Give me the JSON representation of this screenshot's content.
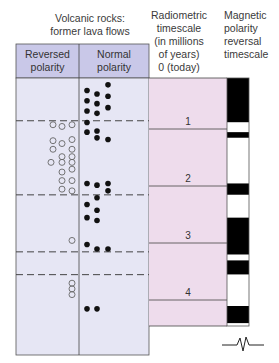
{
  "headers": {
    "volcanic_title": "Volcanic rocks: former lava flows",
    "volcanic_title_line1": "Volcanic rocks:",
    "volcanic_title_line2": "former lava flows",
    "reversed_line1": "Reversed",
    "reversed_line2": "polarity",
    "normal_line1": "Normal",
    "normal_line2": "polarity",
    "radiometric_lines": [
      "Radiometric",
      "timescale",
      "(in millions",
      "of years)",
      "0 (today)"
    ],
    "magnetic_lines": [
      "Magnetic",
      "polarity",
      "reversal",
      "timescale"
    ]
  },
  "colors": {
    "header_fill": "#c9c8e8",
    "body_fill": "#e6e6f4",
    "timescale_fill": "#eedcec",
    "normal_band": "#000000",
    "reversed_band": "#ffffff",
    "dot_fill": "#111111",
    "circle_stroke": "#666666"
  },
  "timescale": {
    "labels": [
      "1",
      "2",
      "3",
      "4"
    ],
    "max_my": 4.5
  },
  "magnetic_bands": [
    {
      "from": 0.0,
      "to": 0.78,
      "polarity": "normal"
    },
    {
      "from": 0.78,
      "to": 0.95,
      "polarity": "reversed"
    },
    {
      "from": 0.95,
      "to": 1.05,
      "polarity": "normal"
    },
    {
      "from": 1.05,
      "to": 1.85,
      "polarity": "reversed"
    },
    {
      "from": 1.85,
      "to": 2.05,
      "polarity": "normal"
    },
    {
      "from": 2.05,
      "to": 2.45,
      "polarity": "reversed"
    },
    {
      "from": 2.45,
      "to": 3.1,
      "polarity": "normal"
    },
    {
      "from": 3.1,
      "to": 3.2,
      "polarity": "reversed"
    },
    {
      "from": 3.2,
      "to": 3.45,
      "polarity": "normal"
    },
    {
      "from": 3.45,
      "to": 4.0,
      "polarity": "reversed"
    },
    {
      "from": 4.0,
      "to": 4.3,
      "polarity": "normal"
    }
  ],
  "polarity_boundaries_my": [
    0.75,
    2.05,
    3.05,
    3.45
  ],
  "normal_flows_my": [
    {
      "age": 0.12,
      "col": 2
    },
    {
      "age": 0.22,
      "col": 0
    },
    {
      "age": 0.28,
      "col": 1
    },
    {
      "age": 0.32,
      "col": 2
    },
    {
      "age": 0.4,
      "col": 0
    },
    {
      "age": 0.45,
      "col": 1
    },
    {
      "age": 0.52,
      "col": 2
    },
    {
      "age": 0.58,
      "col": 0
    },
    {
      "age": 0.62,
      "col": 1
    },
    {
      "age": 0.78,
      "col": 0
    },
    {
      "age": 0.95,
      "col": 0
    },
    {
      "age": 0.93,
      "col": 1
    },
    {
      "age": 1.05,
      "col": 1
    },
    {
      "age": 1.08,
      "col": 2
    },
    {
      "age": 1.85,
      "col": 0
    },
    {
      "age": 1.88,
      "col": 1
    },
    {
      "age": 1.85,
      "col": 2
    },
    {
      "age": 1.98,
      "col": 2
    },
    {
      "age": 2.1,
      "col": 1
    },
    {
      "age": 2.22,
      "col": 0
    },
    {
      "age": 2.32,
      "col": 1
    },
    {
      "age": 2.45,
      "col": 0
    },
    {
      "age": 2.5,
      "col": 1
    },
    {
      "age": 2.92,
      "col": 0
    },
    {
      "age": 3.0,
      "col": 1
    },
    {
      "age": 3.0,
      "col": 2
    },
    {
      "age": 4.05,
      "col": 0
    },
    {
      "age": 4.05,
      "col": 1
    }
  ],
  "reversed_flows_my": [
    {
      "age": 0.82,
      "col": 0
    },
    {
      "age": 0.85,
      "col": 1
    },
    {
      "age": 0.82,
      "col": 2
    },
    {
      "age": 1.1,
      "col": 0
    },
    {
      "age": 1.15,
      "col": 1
    },
    {
      "age": 1.08,
      "col": 2
    },
    {
      "age": 1.25,
      "col": 0
    },
    {
      "age": 1.25,
      "col": 2
    },
    {
      "age": 1.38,
      "col": 1
    },
    {
      "age": 1.38,
      "col": 2
    },
    {
      "age": 1.48,
      "col": -1
    },
    {
      "age": 1.48,
      "col": 1
    },
    {
      "age": 1.48,
      "col": 2
    },
    {
      "age": 1.65,
      "col": 1
    },
    {
      "age": 1.6,
      "col": 2
    },
    {
      "age": 1.8,
      "col": 1
    },
    {
      "age": 1.8,
      "col": 2
    },
    {
      "age": 1.95,
      "col": 1
    },
    {
      "age": 1.98,
      "col": 2
    },
    {
      "age": 2.85,
      "col": 2
    },
    {
      "age": 3.6,
      "col": 2
    },
    {
      "age": 3.7,
      "col": 2
    },
    {
      "age": 3.8,
      "col": 2
    }
  ]
}
